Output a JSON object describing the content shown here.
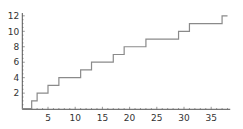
{
  "chart_data": {
    "type": "line",
    "subtype": "step",
    "title": "",
    "xlabel": "",
    "ylabel": "",
    "x": [
      0,
      2,
      3,
      5,
      7,
      11,
      13,
      17,
      19,
      23,
      29,
      31,
      37,
      38
    ],
    "values": [
      0,
      1,
      2,
      3,
      4,
      5,
      6,
      7,
      8,
      9,
      10,
      11,
      12,
      12
    ],
    "series": [
      {
        "name": "step function",
        "x": [
          0,
          2,
          3,
          5,
          7,
          11,
          13,
          17,
          19,
          23,
          29,
          31,
          37,
          38
        ],
        "values": [
          0,
          1,
          2,
          3,
          4,
          5,
          6,
          7,
          8,
          9,
          10,
          11,
          12,
          12
        ]
      }
    ],
    "xlim": [
      0.3,
      38.5
    ],
    "ylim": [
      0,
      12.3
    ],
    "xticks": [
      5,
      10,
      15,
      20,
      25,
      30,
      35
    ],
    "yticks": [
      2,
      4,
      6,
      8,
      10,
      12
    ],
    "grid": false,
    "legend": null,
    "line_color": "#8a8a8a",
    "axis_color": "#555555"
  }
}
